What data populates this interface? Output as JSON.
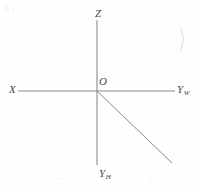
{
  "figure": {
    "background_color": "#fefefe",
    "stroke_color": "#8a8a8a",
    "label_color": "#4a4a4a",
    "width": 200,
    "height": 188
  },
  "labels": {
    "z_axis": "Z",
    "x_axis": "X",
    "y_width_base": "Y",
    "y_width_subscript": "W",
    "y_height_base": "Y",
    "y_height_subscript": "H",
    "origin": "O"
  },
  "geometry": {
    "origin": {
      "x": 97,
      "y": 91
    },
    "vertical_axis": {
      "x": 97,
      "y_top": 20,
      "y_bottom": 165
    },
    "horizontal_axis": {
      "y": 91,
      "x_left": 18,
      "x_right": 175
    },
    "diagonal_ray": {
      "x1": 97,
      "y1": 91,
      "x2": 172,
      "y2": 163
    },
    "artifact_curve": {
      "x": 180,
      "y": 30,
      "width": 6,
      "height": 22
    }
  }
}
